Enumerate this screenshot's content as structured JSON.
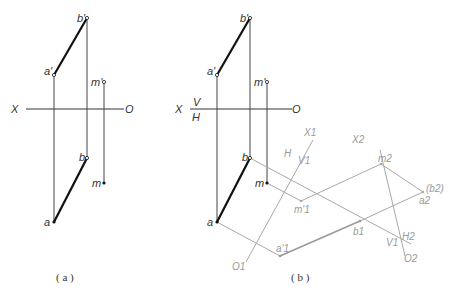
{
  "figure_a": {
    "caption": "( a )",
    "axis": {
      "left": "X",
      "right": "O"
    },
    "points": {
      "a_prime": "a'",
      "b_prime": "b'",
      "m_prime": "m'",
      "a": "a",
      "b": "b",
      "m": "m"
    }
  },
  "figure_b": {
    "caption": "( b )",
    "axis": {
      "left": "X",
      "right": "O",
      "upper_plane": "V",
      "lower_plane": "H"
    },
    "points": {
      "a_prime": "a'",
      "b_prime": "b'",
      "m_prime": "m'",
      "a": "a",
      "b": "b",
      "m": "m",
      "a1": "a'1",
      "b1": "b1",
      "m1": "m'1",
      "a2": "a2",
      "b2": "(b2)",
      "m2": "m2"
    },
    "aux_axis_1": {
      "top": "X1",
      "bottom": "O1",
      "left_plane": "H",
      "right_plane": "V1"
    },
    "aux_axis_2": {
      "top": "X2",
      "bottom": "O2",
      "left_plane": "V1",
      "right_plane": "H2"
    }
  },
  "colors": {
    "main_line": "#222222",
    "aux_line": "#a8a8a8",
    "aux_text": "#9a9a9a"
  }
}
